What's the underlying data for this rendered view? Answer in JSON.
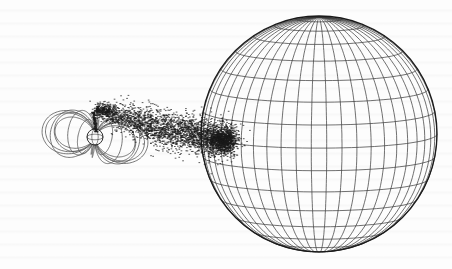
{
  "figure": {
    "colors": {
      "ink": "#1a1a1a",
      "field_line": "#555555",
      "grid_line": "#333333",
      "background": "#fdfdfd"
    },
    "large_star": {
      "cx": 319,
      "cy": 134,
      "r": 118,
      "meridians": 24,
      "parallels": 16
    },
    "compact_star": {
      "cx": 95,
      "cy": 137,
      "r": 8
    },
    "field_loops": {
      "count": 6,
      "extent_left": 16,
      "extent_top": 79,
      "extent_bottom": 193
    },
    "stream": {
      "start": [
        92,
        110
      ],
      "end": [
        228,
        142
      ],
      "particles": 2600
    }
  }
}
